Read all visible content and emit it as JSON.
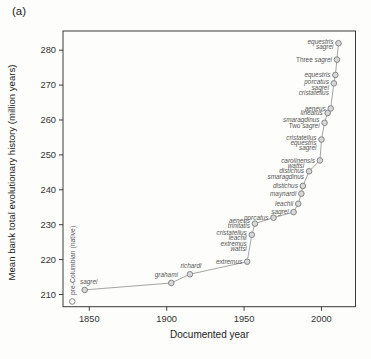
{
  "figure": {
    "panel_label": "(a)"
  },
  "chart_data": {
    "type": "line",
    "title": "",
    "xlabel": "Documented year",
    "ylabel": "Mean bank total evolutionary history (million years)",
    "xlim": [
      1833,
      2022
    ],
    "ylim": [
      206.5,
      285.5
    ],
    "xticks": [
      "1850",
      "1900",
      "1950",
      "2000"
    ],
    "yticks": [
      "210",
      "220",
      "230",
      "240",
      "250",
      "260",
      "270",
      "280"
    ],
    "grid": false,
    "legend": false,
    "line_color": "#9a9a9a",
    "marker_fill": "#d8d8d8",
    "marker_open_fill": "#fdfdfb",
    "marker_stroke": "#7a7a7a",
    "axis_color": "#3a3a3a",
    "points": [
      {
        "year": 1839,
        "value": 208.0,
        "marker": "open",
        "connected": false,
        "labels": [
          "pre-Columbian (native)"
        ],
        "label_pos": "vertical"
      },
      {
        "year": 1847,
        "value": 211.3,
        "labels": [
          "sagrei"
        ],
        "label_pos": "above",
        "dx": 4
      },
      {
        "year": 1903,
        "value": 213.3,
        "labels": [
          "grahami"
        ],
        "label_pos": "above",
        "dx": -5
      },
      {
        "year": 1915,
        "value": 215.8,
        "labels": [
          "richardi"
        ],
        "label_pos": "above",
        "dx": 1
      },
      {
        "year": 1952,
        "value": 219.4,
        "labels": [
          "extremus"
        ]
      },
      {
        "year": 1955,
        "value": 227.1,
        "labels": [
          "cristatellus",
          "leachii",
          "extremus",
          "wattsi"
        ],
        "dy": 6
      },
      {
        "year": 1957,
        "value": 230.3,
        "labels": [
          "aeneus",
          "trinitatis"
        ]
      },
      {
        "year": 1969,
        "value": 232.0,
        "labels": [
          "porcatus"
        ]
      },
      {
        "year": 1982,
        "value": 233.6,
        "labels": [
          "sagrei"
        ]
      },
      {
        "year": 1985,
        "value": 236.0,
        "labels": [
          "leachii"
        ]
      },
      {
        "year": 1987,
        "value": 238.9,
        "labels": [
          "maynardi"
        ]
      },
      {
        "year": 1988,
        "value": 241.1,
        "labels": [
          "distichus"
        ]
      },
      {
        "year": 1992,
        "value": 245.3,
        "labels": [
          "wattsi",
          "distichus",
          "smaragdinus"
        ]
      },
      {
        "year": 1999,
        "value": 248.4,
        "labels": [
          "carolinensis"
        ]
      },
      {
        "year": 2000,
        "value": 254.4,
        "labels": [
          "cristatellus",
          "equestris",
          "sagrei"
        ],
        "dy": 3
      },
      {
        "year": 2002,
        "value": 259.2,
        "labels": [
          "smaragdinus",
          "Two sagrei"
        ]
      },
      {
        "year": 2004,
        "value": 262.0,
        "labels": [
          "lineatus"
        ]
      },
      {
        "year": 2006,
        "value": 263.3,
        "labels": [
          "aeneus"
        ]
      },
      {
        "year": 2008,
        "value": 270.5,
        "labels": [
          "porcatus",
          "sagrei",
          "cristatellus"
        ],
        "dy": 4
      },
      {
        "year": 2009,
        "value": 272.9,
        "labels": [
          "equestris"
        ]
      },
      {
        "year": 2010,
        "value": 277.3,
        "labels": [
          "Three sagrei"
        ]
      },
      {
        "year": 2011,
        "value": 282.0,
        "labels": [
          "equestris",
          "sagrei"
        ],
        "dy": 1
      }
    ]
  }
}
